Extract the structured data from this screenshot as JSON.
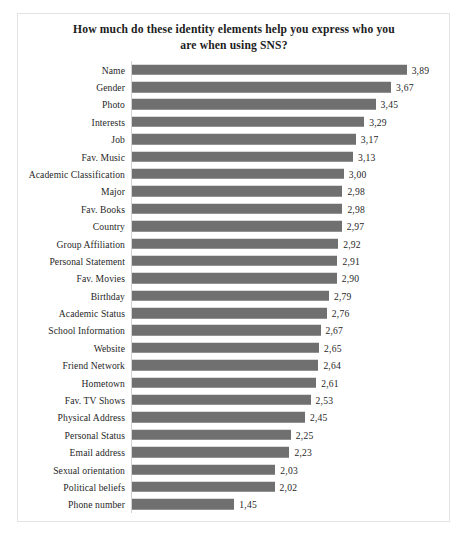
{
  "chart_data": {
    "type": "bar",
    "orientation": "horizontal",
    "title": "How much do these identity elements help you express who you are when using SNS?",
    "title_line1": "How much do these identity elements help you express who you",
    "title_line2": "are when using SNS?",
    "xlabel": "",
    "ylabel": "",
    "xlim": [
      0,
      4
    ],
    "grid": false,
    "legend": null,
    "decimal_separator": ",",
    "bar_color": "#707070",
    "categories": [
      "Name",
      "Gender",
      "Photo",
      "Interests",
      "Job",
      "Fav. Music",
      "Academic Classification",
      "Major",
      "Fav. Books",
      "Country",
      "Group Affiliation",
      "Personal Statement",
      "Fav. Movies",
      "Birthday",
      "Academic Status",
      "School Information",
      "Website",
      "Friend Network",
      "Hometown",
      "Fav. TV Shows",
      "Physical Address",
      "Personal Status",
      "Email address",
      "Sexual orientation",
      "Political beliefs",
      "Phone number"
    ],
    "values": [
      3.89,
      3.67,
      3.45,
      3.29,
      3.17,
      3.13,
      3.0,
      2.98,
      2.98,
      2.97,
      2.92,
      2.91,
      2.9,
      2.79,
      2.76,
      2.67,
      2.65,
      2.64,
      2.61,
      2.53,
      2.45,
      2.25,
      2.23,
      2.03,
      2.02,
      1.45
    ],
    "value_labels": [
      "3,89",
      "3,67",
      "3,45",
      "3,29",
      "3,17",
      "3,13",
      "3,00",
      "2,98",
      "2,98",
      "2,97",
      "2,92",
      "2,91",
      "2,90",
      "2,79",
      "2,76",
      "2,67",
      "2,65",
      "2,64",
      "2,61",
      "2,53",
      "2,45",
      "2,25",
      "2,23",
      "2,03",
      "2,02",
      "1,45"
    ]
  }
}
